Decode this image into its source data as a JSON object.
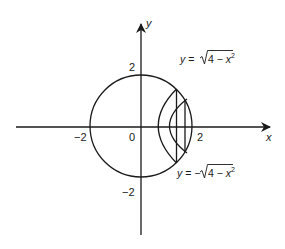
{
  "diagram": {
    "title": "",
    "axes": {
      "x_label": "x",
      "y_label": "y",
      "ticks": {
        "x_neg": "−2",
        "origin": "0",
        "x_pos": "2",
        "y_pos": "2",
        "y_neg": "−2"
      }
    },
    "curves": {
      "upper": {
        "lhs": "y = ",
        "sign": "",
        "radicand": "4 − x",
        "exponent": "2"
      },
      "lower": {
        "lhs": "y = ",
        "sign": "−",
        "radicand": "4 − x",
        "exponent": "2"
      }
    },
    "shapes": {
      "circle": {
        "center": [
          0,
          0
        ],
        "radius": 2
      },
      "outer_shell": {
        "x_line": 1.4,
        "arc_vertex_x": 0.56
      },
      "inner_shell": {
        "x_line": 1.76,
        "arc_vertex_x": 1.0
      }
    },
    "colors": {
      "ink": "#1a1a1a",
      "background": "#ffffff"
    }
  }
}
